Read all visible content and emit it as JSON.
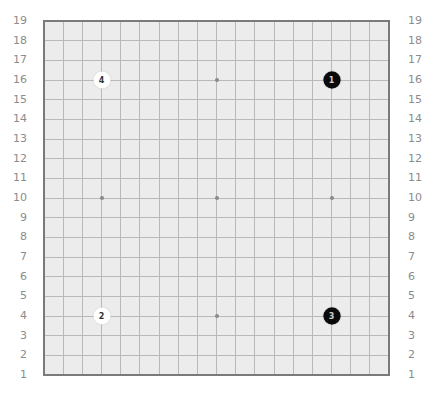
{
  "board": {
    "size": 19,
    "background_color": "#ececec",
    "line_color": "#b9b9b9",
    "border_color": "#7a7a7a",
    "row_labels": [
      "19",
      "18",
      "17",
      "16",
      "15",
      "14",
      "13",
      "12",
      "11",
      "10",
      "9",
      "8",
      "7",
      "6",
      "5",
      "4",
      "3",
      "2",
      "1"
    ],
    "star_points": [
      {
        "col": 4,
        "row": 16
      },
      {
        "col": 10,
        "row": 16
      },
      {
        "col": 16,
        "row": 16
      },
      {
        "col": 4,
        "row": 10
      },
      {
        "col": 10,
        "row": 10
      },
      {
        "col": 16,
        "row": 10
      },
      {
        "col": 4,
        "row": 4
      },
      {
        "col": 10,
        "row": 4
      },
      {
        "col": 16,
        "row": 4
      }
    ],
    "stones": [
      {
        "move": "1",
        "color": "black",
        "col": 16,
        "row": 16
      },
      {
        "move": "2",
        "color": "white",
        "col": 4,
        "row": 4
      },
      {
        "move": "3",
        "color": "black",
        "col": 16,
        "row": 4
      },
      {
        "move": "4",
        "color": "white",
        "col": 4,
        "row": 16
      }
    ]
  }
}
